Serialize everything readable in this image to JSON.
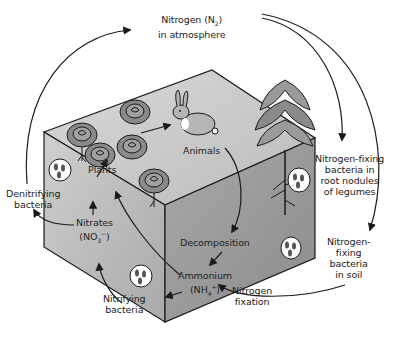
{
  "diagram": {
    "type": "nitrogen-cycle",
    "colors": {
      "background": "#ffffff",
      "cube_top": "#c8c8c8",
      "cube_front": "#bdbdbd",
      "cube_side": "#9e9e9e",
      "ink": "#1a1a1a"
    },
    "labels": {
      "atmosphere_line1": "Nitrogen (N",
      "atmosphere_sub": "2",
      "atmosphere_close": ")",
      "atmosphere_line2": "in atmosphere",
      "animals": "Animals",
      "plants": "Plants",
      "denitrifying_line1": "Denitrifying",
      "denitrifying_line2": "bacteria",
      "nitrates_line1": "Nitrates",
      "nitrates_line2_open": "(NO",
      "nitrates_sub": "3",
      "nitrates_sup": "−",
      "nitrates_close": ")",
      "nitrifying_line1": "Nitrifying",
      "nitrifying_line2": "bacteria",
      "decomposition": "Decomposition",
      "ammonium_line1": "Ammonium",
      "ammonium_line2_open": "(NH",
      "ammonium_sub": "4",
      "ammonium_sup": "+",
      "ammonium_close": ")",
      "nitrogen_fixation_line1": "Nitrogen",
      "nitrogen_fixation_line2": "fixation",
      "legume_bacteria_line1": "Nitrogen-fixing",
      "legume_bacteria_line2": "bacteria in",
      "legume_bacteria_line3": "root nodules",
      "legume_bacteria_line4": "of legumes",
      "soil_bacteria_line1": "Nitrogen-",
      "soil_bacteria_line2": "fixing",
      "soil_bacteria_line3": "bacteria",
      "soil_bacteria_line4": "in soil"
    },
    "illustrations": [
      "cabbage-plant",
      "cabbage-plant",
      "cabbage-plant",
      "cabbage-plant",
      "cabbage-plant",
      "rabbit",
      "legume-plant",
      "bacteria-cell",
      "bacteria-cell",
      "bacteria-cell",
      "bacteria-cell"
    ],
    "flows": [
      {
        "from": "Denitrifying bacteria",
        "to": "Nitrogen (N2) in atmosphere"
      },
      {
        "from": "Nitrogen (N2) in atmosphere",
        "to": "Nitrogen-fixing bacteria in root nodules of legumes"
      },
      {
        "from": "Nitrogen (N2) in atmosphere",
        "to": "Nitrogen-fixing bacteria in soil"
      },
      {
        "from": "Nitrogen-fixing bacteria in soil",
        "to": "Ammonium (NH4+)"
      },
      {
        "from": "Plants",
        "to": "Animals"
      },
      {
        "from": "Animals",
        "to": "Decomposition"
      },
      {
        "from": "Decomposition",
        "to": "Ammonium (NH4+)"
      },
      {
        "from": "Ammonium (NH4+)",
        "to": "Nitrifying bacteria"
      },
      {
        "from": "Nitrifying bacteria",
        "to": "Nitrates (NO3-)"
      },
      {
        "from": "Nitrates (NO3-)",
        "to": "Plants"
      },
      {
        "from": "Nitrates (NO3-)",
        "to": "Denitrifying bacteria"
      },
      {
        "from": "Ammonium (NH4+)",
        "to": "Plants"
      }
    ]
  }
}
